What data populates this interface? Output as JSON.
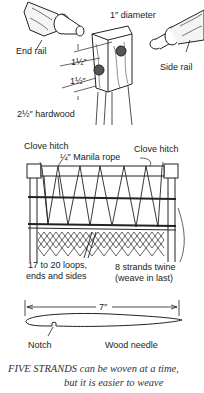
{
  "figure_1": {
    "title": "Rail joint detail",
    "labels": {
      "diameter": "1″ diameter",
      "end_rail": "End rail",
      "side_rail": "Side rail",
      "spacing_top": "1½″",
      "spacing_bottom": "1½″",
      "post": "2½″ hardwood"
    }
  },
  "figure_2": {
    "title": "Weaving pattern",
    "labels": {
      "clove_hitch_left": "Clove hitch",
      "clove_hitch_right": "Clove hitch",
      "rope": "¼″ Manila rope",
      "loops_line1": "17 to 20 loops,",
      "loops_line2": "ends and sides",
      "twine_line1": "8 strands twine",
      "twine_line2": "(weave in last)"
    }
  },
  "figure_3": {
    "title": "Wood needle",
    "labels": {
      "length": "7″",
      "notch": "Notch",
      "needle": "Wood needle"
    }
  },
  "caption": {
    "lead": "FIVE STRANDS",
    "line1_rest": " can be woven at a time,",
    "line2": "but it is easier to weave"
  }
}
